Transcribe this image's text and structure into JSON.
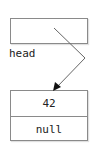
{
  "diagram": {
    "type": "linked-list",
    "head_pointer": {
      "label": "head"
    },
    "nodes": [
      {
        "data": "42",
        "next": "null"
      }
    ],
    "colors": {
      "border": "#8a8a8a",
      "text": "#222222",
      "arrow": "#666666",
      "arrowhead": "#111111"
    }
  }
}
